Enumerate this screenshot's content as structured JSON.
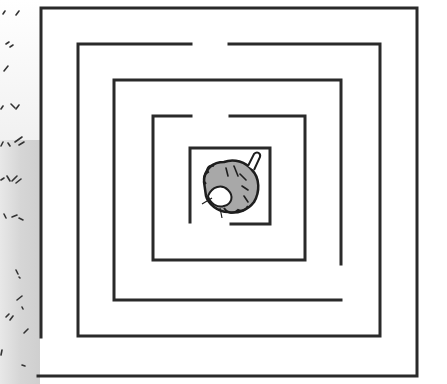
{
  "image": {
    "description": "Hand-drawn square concentric maze with a small furry creature (mouse) in the center box",
    "width": 447,
    "height": 384
  },
  "colors": {
    "wall": "#2a2a2a",
    "background": "#ffffff",
    "creature_fill": "#a8a8a8",
    "creature_outline": "#1e1e1e",
    "shaded_strip": "#d0d0d0"
  },
  "maze": {
    "rings": [
      {
        "name": "outer-ring",
        "top": 8,
        "left": 40,
        "right": 417,
        "bottom": 376,
        "openings": [
          "bottom-left of left wall"
        ]
      },
      {
        "name": "second-ring",
        "top": 44,
        "left": 78,
        "right": 380,
        "bottom": 336,
        "openings": [
          "top gap x 191-229"
        ]
      },
      {
        "name": "third-ring",
        "top": 80,
        "left": 114,
        "right": 341,
        "bottom": 300,
        "openings": [
          "right wall gap bottom"
        ]
      },
      {
        "name": "fourth-ring",
        "top": 116,
        "left": 153,
        "right": 305,
        "bottom": 260,
        "openings": [
          "top gap x 191-230"
        ]
      },
      {
        "name": "center-box",
        "top": 148,
        "left": 190,
        "right": 270,
        "bottom": 224,
        "openings": [
          "bottom-left gap"
        ]
      }
    ],
    "goal": "mouse-creature"
  }
}
